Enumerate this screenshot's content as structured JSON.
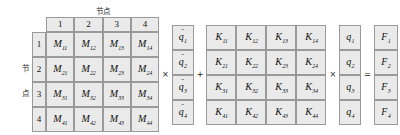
{
  "equation": {
    "description": "M q-double-dot + K q = F",
    "top_axis_label": "节点",
    "side_axis_label_chars": [
      "节",
      "点"
    ],
    "column_headers": [
      "1",
      "2",
      "3",
      "4"
    ],
    "row_headers": [
      "1",
      "2",
      "3",
      "4"
    ],
    "operators": {
      "multiply_1": "×",
      "plus": "+",
      "multiply_2": "×",
      "equals": "="
    },
    "mass_matrix": {
      "symbol": "M",
      "rows": [
        [
          {
            "base": "M",
            "sub": "11"
          },
          {
            "base": "M",
            "sub": "12"
          },
          {
            "base": "M",
            "sub": "13"
          },
          {
            "base": "M",
            "sub": "14"
          }
        ],
        [
          {
            "base": "M",
            "sub": "21"
          },
          {
            "base": "M",
            "sub": "22"
          },
          {
            "base": "M",
            "sub": "23"
          },
          {
            "base": "M",
            "sub": "24"
          }
        ],
        [
          {
            "base": "M",
            "sub": "31"
          },
          {
            "base": "M",
            "sub": "32"
          },
          {
            "base": "M",
            "sub": "33"
          },
          {
            "base": "M",
            "sub": "34"
          }
        ],
        [
          {
            "base": "M",
            "sub": "41"
          },
          {
            "base": "M",
            "sub": "42"
          },
          {
            "base": "M",
            "sub": "43"
          },
          {
            "base": "M",
            "sub": "44"
          }
        ]
      ]
    },
    "acceleration_vector": {
      "symbol": "q",
      "accent": "¨",
      "cells": [
        {
          "base": "q",
          "sub": "1"
        },
        {
          "base": "q",
          "sub": "2"
        },
        {
          "base": "q",
          "sub": "3"
        },
        {
          "base": "q",
          "sub": "4"
        }
      ]
    },
    "stiffness_matrix": {
      "symbol": "K",
      "rows": [
        [
          {
            "base": "K",
            "sub": "11"
          },
          {
            "base": "K",
            "sub": "12"
          },
          {
            "base": "K",
            "sub": "13"
          },
          {
            "base": "K",
            "sub": "14"
          }
        ],
        [
          {
            "base": "K",
            "sub": "21"
          },
          {
            "base": "K",
            "sub": "22"
          },
          {
            "base": "K",
            "sub": "23"
          },
          {
            "base": "K",
            "sub": "24"
          }
        ],
        [
          {
            "base": "K",
            "sub": "31"
          },
          {
            "base": "K",
            "sub": "32"
          },
          {
            "base": "K",
            "sub": "33"
          },
          {
            "base": "K",
            "sub": "34"
          }
        ],
        [
          {
            "base": "K",
            "sub": "41"
          },
          {
            "base": "K",
            "sub": "42"
          },
          {
            "base": "K",
            "sub": "43"
          },
          {
            "base": "K",
            "sub": "44"
          }
        ]
      ]
    },
    "displacement_vector": {
      "symbol": "q",
      "cells": [
        {
          "base": "q",
          "sub": "1"
        },
        {
          "base": "q",
          "sub": "2"
        },
        {
          "base": "q",
          "sub": "3"
        },
        {
          "base": "q",
          "sub": "4"
        }
      ]
    },
    "force_vector": {
      "symbol": "F",
      "cells": [
        {
          "base": "F",
          "sub": "1"
        },
        {
          "base": "F",
          "sub": "2"
        },
        {
          "base": "F",
          "sub": "3"
        },
        {
          "base": "F",
          "sub": "4"
        }
      ]
    },
    "colors": {
      "cell_fill": "#eaeaea",
      "cell_border": "#9a9a9a",
      "text": "#111111"
    }
  }
}
